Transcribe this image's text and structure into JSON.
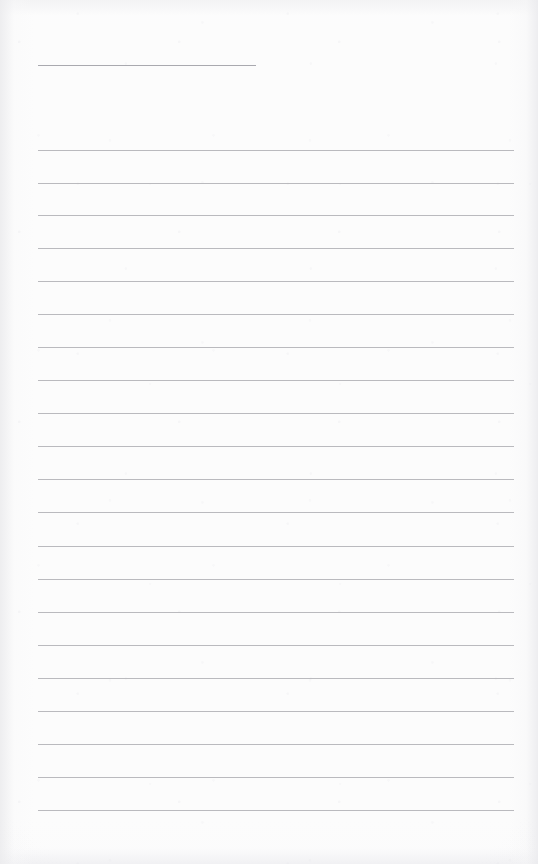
{
  "document": {
    "type": "blank-lined-paper-scan",
    "page_width": 538,
    "page_height": 864,
    "background_color": "#fcfcfc",
    "rule_color": "#b4b4b9",
    "header_rule_color": "#a9a9af",
    "body_text": "",
    "header_text": ""
  },
  "header_rule": {
    "name": "header-rule",
    "x": 38,
    "y": 65,
    "width": 218
  },
  "ruled_lines": [
    {
      "index": 1,
      "x": 38,
      "y": 150,
      "width": 476
    },
    {
      "index": 2,
      "x": 38,
      "y": 183,
      "width": 476
    },
    {
      "index": 3,
      "x": 38,
      "y": 215,
      "width": 476
    },
    {
      "index": 4,
      "x": 38,
      "y": 248,
      "width": 476
    },
    {
      "index": 5,
      "x": 38,
      "y": 281,
      "width": 476
    },
    {
      "index": 6,
      "x": 38,
      "y": 314,
      "width": 476
    },
    {
      "index": 7,
      "x": 38,
      "y": 347,
      "width": 476
    },
    {
      "index": 8,
      "x": 38,
      "y": 380,
      "width": 476
    },
    {
      "index": 9,
      "x": 38,
      "y": 413,
      "width": 476
    },
    {
      "index": 10,
      "x": 38,
      "y": 446,
      "width": 476
    },
    {
      "index": 11,
      "x": 38,
      "y": 479,
      "width": 476
    },
    {
      "index": 12,
      "x": 38,
      "y": 512,
      "width": 476
    },
    {
      "index": 13,
      "x": 38,
      "y": 546,
      "width": 476
    },
    {
      "index": 14,
      "x": 38,
      "y": 579,
      "width": 476
    },
    {
      "index": 15,
      "x": 38,
      "y": 612,
      "width": 476
    },
    {
      "index": 16,
      "x": 38,
      "y": 645,
      "width": 476
    },
    {
      "index": 17,
      "x": 38,
      "y": 678,
      "width": 476
    },
    {
      "index": 18,
      "x": 38,
      "y": 711,
      "width": 476
    },
    {
      "index": 19,
      "x": 38,
      "y": 744,
      "width": 476
    },
    {
      "index": 20,
      "x": 38,
      "y": 777,
      "width": 476
    },
    {
      "index": 21,
      "x": 38,
      "y": 810,
      "width": 476
    }
  ]
}
